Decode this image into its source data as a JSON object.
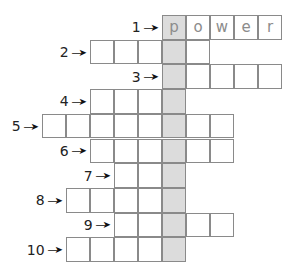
{
  "puzzle": {
    "origin_x": 42,
    "origin_y": 15,
    "cell_w": 24,
    "cell_h": 24.7,
    "shaded_col": 5,
    "shaded_color": "#dcdcdc",
    "border_color": "#8a8a8a",
    "letter_color": "#8c8c8c",
    "arrow_glyph": "➤",
    "rows": [
      {
        "number": "1",
        "start_col": 5,
        "length": 5,
        "letters": [
          "p",
          "o",
          "w",
          "e",
          "r"
        ]
      },
      {
        "number": "2",
        "start_col": 2,
        "length": 5,
        "letters": []
      },
      {
        "number": "3",
        "start_col": 5,
        "length": 5,
        "letters": []
      },
      {
        "number": "4",
        "start_col": 2,
        "length": 4,
        "letters": []
      },
      {
        "number": "5",
        "start_col": 0,
        "length": 8,
        "letters": []
      },
      {
        "number": "6",
        "start_col": 2,
        "length": 6,
        "letters": []
      },
      {
        "number": "7",
        "start_col": 3,
        "length": 3,
        "letters": []
      },
      {
        "number": "8",
        "start_col": 1,
        "length": 5,
        "letters": []
      },
      {
        "number": "9",
        "start_col": 3,
        "length": 5,
        "letters": []
      },
      {
        "number": "10",
        "start_col": 1,
        "length": 5,
        "letters": []
      }
    ]
  }
}
